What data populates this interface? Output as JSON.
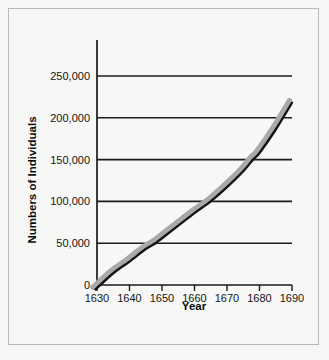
{
  "chart_data": {
    "type": "line",
    "title": "",
    "xlabel": "Year",
    "ylabel": "Numbers of Individuals",
    "xlim": [
      1630,
      1690
    ],
    "ylim": [
      0,
      265000
    ],
    "grid": true,
    "legend": null,
    "x_ticks": [
      "1630",
      "1640",
      "1650",
      "1660",
      "1670",
      "1680",
      "1690"
    ],
    "x_tick_values": [
      1630,
      1640,
      1650,
      1660,
      1670,
      1680,
      1690
    ],
    "y_ticks": [
      "0",
      "50,000",
      "100,000",
      "150,000",
      "200,000",
      "250,000"
    ],
    "y_tick_values": [
      0,
      50000,
      100000,
      150000,
      200000,
      250000
    ],
    "series": [
      {
        "name": "Population",
        "x": [
          1630,
          1635,
          1640,
          1645,
          1648,
          1650,
          1655,
          1660,
          1665,
          1670,
          1675,
          1678,
          1680,
          1685,
          1690
        ],
        "values": [
          0,
          14000,
          28000,
          43000,
          50000,
          56000,
          71000,
          86000,
          100000,
          117000,
          136000,
          150000,
          158000,
          186000,
          218000
        ]
      }
    ],
    "annotations": [],
    "colors": {
      "line": "#141414",
      "shadow": "#a9a9a9",
      "grid": "#1b1b1b",
      "background": "#f7f7f5",
      "border": "#b9b9b9"
    }
  }
}
